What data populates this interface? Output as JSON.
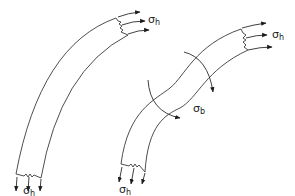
{
  "diagram": {
    "left_segment": {
      "top_label": {
        "symbol": "σ",
        "subscript": "h"
      },
      "bottom_label": {
        "symbol": "σ",
        "subscript": "h"
      }
    },
    "right_segment": {
      "top_label": {
        "symbol": "σ",
        "subscript": "h"
      },
      "bottom_label": {
        "symbol": "σ",
        "subscript": "h"
      },
      "bending_label": {
        "symbol": "σ",
        "subscript": "b"
      }
    },
    "colors": {
      "stroke": "#3a3a3a",
      "background": "#ffffff"
    }
  }
}
